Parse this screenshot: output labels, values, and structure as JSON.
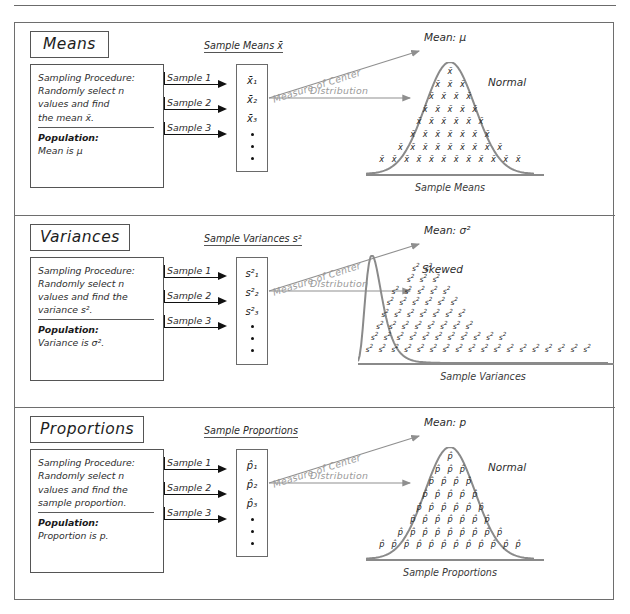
{
  "document": {
    "title": "Sampling Distributions",
    "panel_count": 3
  },
  "labels": {
    "measure_of_center": "Measure of Center",
    "distribution": "Distribution",
    "sample_1": "Sample 1",
    "sample_2": "Sample 2",
    "sample_3": "Sample 3",
    "population_heading": "Population:"
  },
  "panels": [
    {
      "id": "means",
      "title": "Means",
      "procedure_lines": [
        "Sampling Procedure:",
        "Randomly select n",
        "values and find",
        "the mean x̄."
      ],
      "population_line": "Mean is μ",
      "list_caption": "Sample Means x̄",
      "list_items": [
        "x̄₁",
        "x̄₂",
        "x̄₃"
      ],
      "mean_label": "Mean: μ",
      "distribution_name": "Normal",
      "axis_caption": "Sample Means",
      "glyph": "x̄",
      "shape": "normal"
    },
    {
      "id": "variances",
      "title": "Variances",
      "procedure_lines": [
        "Sampling Procedure:",
        "Randomly select n",
        "values and find the",
        "variance s²."
      ],
      "population_line": "Variance is σ².",
      "list_caption": "Sample Variances s²",
      "list_items": [
        "s²₁",
        "s²₂",
        "s²₃"
      ],
      "mean_label": "Mean: σ²",
      "distribution_name": "Skewed",
      "axis_caption": "Sample Variances",
      "glyph": "s²",
      "shape": "skewed"
    },
    {
      "id": "proportions",
      "title": "Proportions",
      "procedure_lines": [
        "Sampling Procedure:",
        "Randomly select n",
        "values and find the",
        "sample proportion."
      ],
      "population_line": "Proportion is p.",
      "list_caption": "Sample Proportions",
      "list_items": [
        "p̂₁",
        "p̂₂",
        "p̂₃"
      ],
      "mean_label": "Mean: p",
      "distribution_name": "Normal",
      "axis_caption": "Sample Proportions",
      "glyph": "p̂",
      "shape": "normal"
    }
  ],
  "chart_data": [
    {
      "type": "bar",
      "title": "Sampling Distribution of Sample Means",
      "xlabel": "Sample Means",
      "ylabel": "",
      "shape": "normal",
      "annotation": "Normal",
      "glyph": "x̄",
      "row_counts_top_to_bottom": [
        1,
        3,
        4,
        5,
        6,
        7,
        9,
        12
      ],
      "total_glyphs": 47
    },
    {
      "type": "bar",
      "title": "Sampling Distribution of Sample Variances",
      "xlabel": "Sample Variances",
      "ylabel": "",
      "shape": "skewed-right",
      "annotation": "Skewed",
      "glyph": "s²",
      "row_counts_top_to_bottom": [
        2,
        3,
        5,
        6,
        7,
        8,
        11,
        18
      ],
      "total_glyphs": 60
    },
    {
      "type": "bar",
      "title": "Sampling Distribution of Sample Proportions",
      "xlabel": "Sample Proportions",
      "ylabel": "",
      "shape": "normal",
      "annotation": "Normal",
      "glyph": "p̂",
      "row_counts_top_to_bottom": [
        1,
        3,
        4,
        5,
        6,
        7,
        9,
        12
      ],
      "total_glyphs": 47
    }
  ],
  "colors": {
    "ink": "#2e2e2e",
    "border": "#6e6e6e",
    "curve": "#8a8a8a",
    "gray_label": "#9a9a9a",
    "arrow_black": "#111111",
    "background": "#ffffff"
  }
}
